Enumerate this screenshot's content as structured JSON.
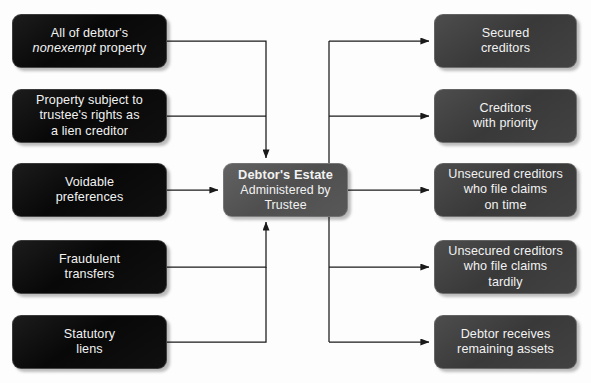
{
  "diagram": {
    "background_color": "#fdfdfd",
    "connector_color": "#1a1a1a",
    "source_box_color": "#0b0b0b",
    "sink_box_color": "#3f3f3f",
    "center_box_color": "#555555",
    "text_color": "#f2f2f2"
  },
  "inputs": [
    {
      "id": "nonexempt-property",
      "line1": "All of debtor's",
      "emphasis": "nonexempt",
      "line2": "property",
      "full_text": "All of debtor's nonexempt property"
    },
    {
      "id": "trustee-lien-rights",
      "line1": "Property subject to",
      "line2": "trustee's rights as",
      "line3": "a lien creditor",
      "full_text": "Property subject to trustee's rights as a lien creditor"
    },
    {
      "id": "voidable-preferences",
      "line1": "Voidable",
      "line2": "preferences",
      "full_text": "Voidable preferences"
    },
    {
      "id": "fraudulent-transfers",
      "line1": "Fraudulent",
      "line2": "transfers",
      "full_text": "Fraudulent transfers"
    },
    {
      "id": "statutory-liens",
      "line1": "Statutory",
      "line2": "liens",
      "full_text": "Statutory liens"
    }
  ],
  "center": {
    "id": "debtors-estate",
    "title": "Debtor's Estate",
    "line2": "Administered by",
    "line3": "Trustee",
    "full_text": "Debtor's Estate Administered by Trustee"
  },
  "outputs": [
    {
      "id": "secured-creditors",
      "line1": "Secured",
      "line2": "creditors",
      "full_text": "Secured creditors"
    },
    {
      "id": "creditors-with-priority",
      "line1": "Creditors",
      "line2": "with priority",
      "full_text": "Creditors with priority"
    },
    {
      "id": "unsecured-on-time",
      "line1": "Unsecured creditors",
      "line2": "who file claims",
      "line3": "on time",
      "full_text": "Unsecured creditors who file claims on time"
    },
    {
      "id": "unsecured-tardily",
      "line1": "Unsecured creditors",
      "line2": "who file claims",
      "line3": "tardily",
      "full_text": "Unsecured creditors who file claims tardily"
    },
    {
      "id": "debtor-remaining-assets",
      "line1": "Debtor receives",
      "line2": "remaining assets",
      "full_text": "Debtor receives remaining assets"
    }
  ]
}
